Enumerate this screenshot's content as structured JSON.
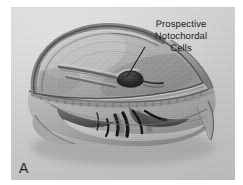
{
  "figure": {
    "panel_label": "A",
    "background_color": "#ffffff",
    "plate_color": "#d2d2d2",
    "ink_color": "#1d1d20"
  },
  "annotations": {
    "notochord_callout": {
      "lines": [
        "Prospective",
        "Notochordal",
        "Cells"
      ],
      "leader_from": [
        134,
        40
      ],
      "leader_to": [
        114,
        72
      ]
    }
  },
  "illustration": {
    "title": "Prospective Notochordal Cells",
    "subject": "embryo cut-away, dorsal hood with archenteron roof",
    "style": "graphite / halftone scientific drawing",
    "parts": [
      "dorsal ectodermal hood",
      "blastoporal groove",
      "prospective notochordal cell patch",
      "involuting marginal zone",
      "archenteron cavity",
      "cut edge of endoderm"
    ]
  }
}
